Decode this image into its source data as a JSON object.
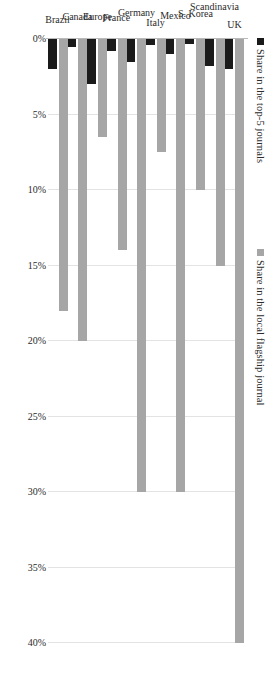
{
  "legend": {
    "items": [
      {
        "label": "Share in the top-5 journals",
        "color": "#1a1a1a",
        "key": "series-b"
      },
      {
        "label": "Share in the local flagship journal",
        "color": "#a6a6a6",
        "key": "series-a"
      }
    ]
  },
  "chart_data": {
    "type": "bar",
    "orientation": "horizontal",
    "title": "",
    "xlabel": "",
    "ylabel": "",
    "grid": true,
    "legend_position": "top",
    "axis_ticks": [
      "0%",
      "5%",
      "10%",
      "15%",
      "20%",
      "25%",
      "30%",
      "35%",
      "40%"
    ],
    "tick_values": [
      0,
      5,
      10,
      15,
      20,
      25,
      30,
      35,
      40
    ],
    "xlim": [
      0,
      40
    ],
    "categories": [
      "UK",
      "Scandinavia",
      "S. Korea",
      "Mexico",
      "Italy",
      "Germany",
      "France",
      "Europe",
      "Canada",
      "Brazil"
    ],
    "series": [
      {
        "name": "Share in the local flagship journal",
        "color": "#a6a6a6",
        "values": [
          40.0,
          15.0,
          10.0,
          30.0,
          7.5,
          30.0,
          14.0,
          6.5,
          20.0,
          18.0
        ]
      },
      {
        "name": "Share in the top-5 journals",
        "color": "#1a1a1a",
        "values": [
          2.0,
          1.8,
          0.3,
          1.0,
          0.4,
          1.5,
          0.8,
          3.0,
          0.5,
          2.0
        ]
      }
    ]
  }
}
